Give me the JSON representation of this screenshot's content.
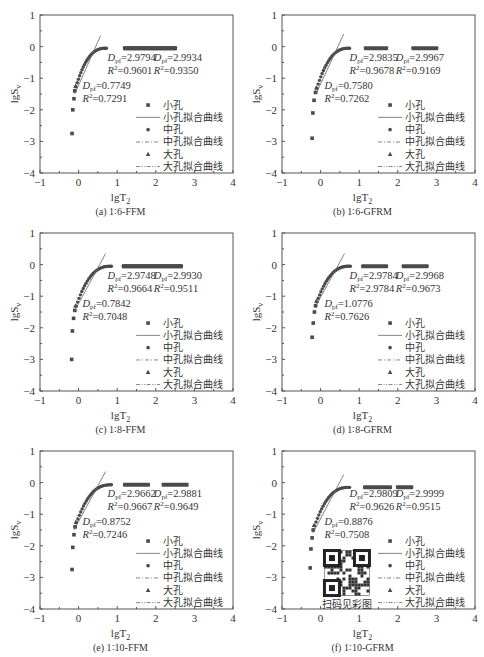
{
  "figure": {
    "xlabel": "lgT",
    "xlabel_sub": "2",
    "ylabel": "lgS",
    "ylabel_sub": "v",
    "x_ticks": [
      "−1",
      "0",
      "1",
      "2",
      "3",
      "4"
    ],
    "y_ticks": [
      "1",
      "0",
      "−1",
      "−2",
      "−3",
      "−4"
    ],
    "legend": [
      {
        "label": "小孔",
        "kind": "square"
      },
      {
        "label": "小孔拟合曲线",
        "kind": "solid"
      },
      {
        "label": "中孔",
        "kind": "circle"
      },
      {
        "label": "中孔拟合曲线",
        "kind": "dashdot"
      },
      {
        "label": "大孔",
        "kind": "triangle"
      },
      {
        "label": "大孔拟合曲线",
        "kind": "dashdotdot"
      }
    ],
    "qr_label": "扫码见彩图",
    "colors": {
      "axis": "#555555",
      "marker": "#4a4a4a",
      "fit": "#666666",
      "text": "#333333"
    }
  },
  "chart_data": [
    {
      "type": "scatter",
      "caption": "(a) 1∶6-FFM",
      "xlabel": "lgT2",
      "ylabel": "lgSv",
      "xlim": [
        -1,
        4
      ],
      "ylim": [
        -4,
        1
      ],
      "annotations": [
        {
          "D": "0.7749",
          "R2": "0.7291"
        },
        {
          "D": "2.9794",
          "R2": "0.9601"
        },
        {
          "D": "2.9934",
          "R2": "0.9350"
        }
      ],
      "small_pore_points": [
        [
          -0.17,
          -2.75
        ],
        [
          -0.15,
          -2.0
        ],
        [
          -0.12,
          -1.65
        ],
        [
          -0.1,
          -1.4
        ]
      ],
      "medium_range": [
        1.15,
        2.55
      ],
      "large_range": [
        1.15,
        2.55
      ],
      "plateau_y": -0.05,
      "fit_line": [
        [
          -0.1,
          -1.5
        ],
        [
          0.57,
          0.35
        ]
      ]
    },
    {
      "type": "scatter",
      "caption": "(b) 1∶6-GFRM",
      "xlabel": "lgT2",
      "ylabel": "lgSv",
      "xlim": [
        -1,
        4
      ],
      "ylim": [
        -4,
        1
      ],
      "annotations": [
        {
          "D": "0.7580",
          "R2": "0.7262"
        },
        {
          "D": "2.9835",
          "R2": "0.9678"
        },
        {
          "D": "2.9967",
          "R2": "0.9169"
        }
      ],
      "small_pore_points": [
        [
          -0.22,
          -2.9
        ],
        [
          -0.2,
          -2.1
        ],
        [
          -0.17,
          -1.7
        ],
        [
          -0.13,
          -1.45
        ]
      ],
      "medium_range": [
        1.12,
        1.75
      ],
      "large_range": [
        2.35,
        3.05
      ],
      "plateau_y": -0.05,
      "fit_line": [
        [
          -0.12,
          -1.5
        ],
        [
          0.6,
          0.4
        ]
      ]
    },
    {
      "type": "scatter",
      "caption": "(c) 1∶8-FFM",
      "xlabel": "lgT2",
      "ylabel": "lgSv",
      "xlim": [
        -1,
        4
      ],
      "ylim": [
        -4,
        1
      ],
      "annotations": [
        {
          "D": "0.7842",
          "R2": "0.7048"
        },
        {
          "D": "2.9748",
          "R2": "0.9664"
        },
        {
          "D": "2.9930",
          "R2": "0.9511"
        }
      ],
      "small_pore_points": [
        [
          -0.18,
          -3.0
        ],
        [
          -0.16,
          -2.1
        ],
        [
          -0.13,
          -1.7
        ],
        [
          -0.1,
          -1.45
        ]
      ],
      "medium_range": [
        1.12,
        2.7
      ],
      "large_range": [
        1.12,
        2.7
      ],
      "plateau_y": -0.05,
      "fit_line": [
        [
          -0.12,
          -1.5
        ],
        [
          0.7,
          0.35
        ]
      ]
    },
    {
      "type": "scatter",
      "caption": "(d) 1∶8-GFRM",
      "xlabel": "lgT2",
      "ylabel": "lgSv",
      "xlim": [
        -1,
        4
      ],
      "ylim": [
        -4,
        1
      ],
      "annotations": [
        {
          "D": "1.0776",
          "R2": "0.7626"
        },
        {
          "D": "2.9784",
          "R2": "2.9784"
        },
        {
          "D": "2.9968",
          "R2": "0.9673"
        }
      ],
      "small_pore_points": [
        [
          -0.22,
          -2.3
        ],
        [
          -0.19,
          -1.85
        ],
        [
          -0.16,
          -1.5
        ],
        [
          -0.13,
          -1.3
        ]
      ],
      "medium_range": [
        1.05,
        1.75
      ],
      "large_range": [
        2.1,
        2.8
      ],
      "plateau_y": -0.05,
      "fit_line": [
        [
          -0.12,
          -1.3
        ],
        [
          0.62,
          0.35
        ]
      ]
    },
    {
      "type": "scatter",
      "caption": "(e) 1∶10-FFM",
      "xlabel": "lgT2",
      "ylabel": "lgSv",
      "xlim": [
        -1,
        4
      ],
      "ylim": [
        -4,
        1
      ],
      "annotations": [
        {
          "D": "0.8752",
          "R2": "0.7246"
        },
        {
          "D": "2.9662",
          "R2": "0.9667"
        },
        {
          "D": "2.9881",
          "R2": "0.9649"
        }
      ],
      "small_pore_points": [
        [
          -0.17,
          -2.75
        ],
        [
          -0.15,
          -2.05
        ],
        [
          -0.12,
          -1.65
        ],
        [
          -0.09,
          -1.4
        ]
      ],
      "medium_range": [
        1.15,
        1.85
      ],
      "large_range": [
        2.15,
        2.85
      ],
      "plateau_y": -0.07,
      "fit_line": [
        [
          -0.12,
          -1.5
        ],
        [
          0.7,
          0.35
        ]
      ]
    },
    {
      "type": "scatter",
      "caption": "(f) 1∶10-GFRM",
      "xlabel": "lgT2",
      "ylabel": "lgSv",
      "xlim": [
        -1,
        4
      ],
      "ylim": [
        -4,
        1
      ],
      "annotations": [
        {
          "D": "0.8876",
          "R2": "0.7508"
        },
        {
          "D": "2.9809",
          "R2": "0.9626"
        },
        {
          "D": "2.9999",
          "R2": "0.9515"
        }
      ],
      "small_pore_points": [
        [
          -0.27,
          -2.7
        ],
        [
          -0.25,
          -2.1
        ],
        [
          -0.22,
          -1.75
        ],
        [
          -0.19,
          -1.5
        ]
      ],
      "medium_range": [
        1.1,
        1.85
      ],
      "large_range": [
        1.95,
        2.4
      ],
      "plateau_y": -0.15,
      "fit_line": [
        [
          -0.2,
          -1.6
        ],
        [
          0.6,
          0.25
        ]
      ]
    }
  ]
}
